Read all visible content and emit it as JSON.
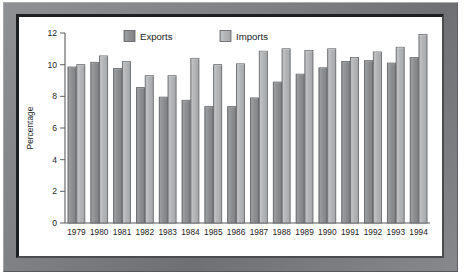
{
  "chart_data": {
    "type": "bar",
    "title": "",
    "xlabel": "",
    "ylabel": "Percentage",
    "ylim": [
      0,
      12
    ],
    "yticks": [
      0,
      2,
      4,
      6,
      8,
      10,
      12
    ],
    "ytick_labels": [
      "0",
      "2",
      "4",
      "6",
      "8",
      "10",
      "12"
    ],
    "grid": false,
    "legend_position": "top-center",
    "categories": [
      "1979",
      "1980",
      "1981",
      "1982",
      "1983",
      "1984",
      "1985",
      "1986",
      "1987",
      "1988",
      "1989",
      "1990",
      "1991",
      "1992",
      "1993",
      "1994"
    ],
    "series": [
      {
        "name": "Exports",
        "color": "#8d8f91",
        "values": [
          9.85,
          10.15,
          9.75,
          8.55,
          7.95,
          7.75,
          7.35,
          7.35,
          7.9,
          8.9,
          9.4,
          9.8,
          10.2,
          10.25,
          10.1,
          10.45
        ]
      },
      {
        "name": "Imports",
        "color": "#b2b4b6",
        "values": [
          10.0,
          10.55,
          10.2,
          9.3,
          9.3,
          10.4,
          10.0,
          10.05,
          10.85,
          11.0,
          10.9,
          11.0,
          10.45,
          10.8,
          11.1,
          11.9
        ]
      }
    ]
  },
  "legend": {
    "items": [
      {
        "label": "Exports",
        "swatch_color": "#8d8f91"
      },
      {
        "label": "Imports",
        "swatch_color": "#b2b4b6"
      }
    ]
  },
  "frame": {
    "outer_color": "#7e8083",
    "inner_border_color": "#1d1f21",
    "plot_background": "#ffffff"
  }
}
